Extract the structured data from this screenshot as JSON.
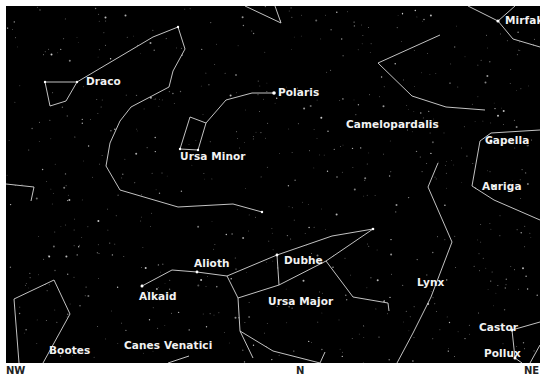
{
  "map": {
    "sky_color": "#000000",
    "line_color": "#d8d8d8",
    "label_color": "#f2f2f2",
    "constellations": [
      {
        "name": "Draco",
        "x": 80,
        "y": 76
      },
      {
        "name": "Ursa Minor",
        "x": 175,
        "y": 151
      },
      {
        "name": "Camelopardalis",
        "x": 340,
        "y": 118
      },
      {
        "name": "Ursa Major",
        "x": 262,
        "y": 296
      },
      {
        "name": "Canes Venatici",
        "x": 118,
        "y": 340
      },
      {
        "name": "Bootes",
        "x": 43,
        "y": 345
      },
      {
        "name": "Lynx",
        "x": 412,
        "y": 277
      },
      {
        "name": "Auriga",
        "x": 476,
        "y": 180
      }
    ],
    "stars": [
      {
        "name": "Polaris",
        "x": 274,
        "y": 87
      },
      {
        "name": "Mirfak",
        "x": 499,
        "y": 14
      },
      {
        "name": "Capella",
        "x": 480,
        "y": 135
      },
      {
        "name": "Alioth",
        "x": 188,
        "y": 258
      },
      {
        "name": "Alkaid",
        "x": 134,
        "y": 291
      },
      {
        "name": "Dubhe",
        "x": 278,
        "y": 254
      },
      {
        "name": "Castor",
        "x": 479,
        "y": 321
      },
      {
        "name": "Pollux",
        "x": 484,
        "y": 347
      }
    ]
  },
  "directions": [
    {
      "label": "NW",
      "x": 6,
      "y": 366
    },
    {
      "label": "N",
      "x": 296,
      "y": 366
    },
    {
      "label": "NE",
      "x": 524,
      "y": 366
    }
  ]
}
